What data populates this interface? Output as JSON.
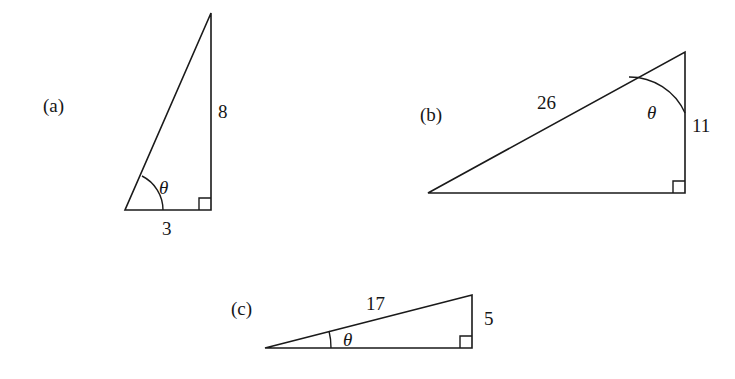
{
  "figure": {
    "background_color": "#ffffff",
    "stroke_color": "#1a1a1a",
    "parts": [
      {
        "id": "a",
        "label": "(a)",
        "label_position": {
          "x": 43,
          "y": 96
        },
        "vertices": {
          "right_angle_corner": {
            "x": 211,
            "y": 210
          },
          "theta_corner": {
            "x": 125,
            "y": 210
          },
          "apex": {
            "x": 211,
            "y": 13
          }
        },
        "sides": [
          {
            "name": "vertical-side",
            "value": "8",
            "x": 218,
            "y": 102
          },
          {
            "name": "horizontal-side",
            "value": "3",
            "x": 162,
            "y": 219
          }
        ],
        "angle": {
          "name": "theta",
          "symbol": "θ",
          "x": 159,
          "y": 178,
          "at": "theta_corner"
        },
        "right_angle_marker": true
      },
      {
        "id": "b",
        "label": "(b)",
        "label_position": {
          "x": 420,
          "y": 105
        },
        "vertices": {
          "right_angle_corner": {
            "x": 685,
            "y": 193
          },
          "theta_corner": {
            "x": 685,
            "y": 52
          },
          "apex": {
            "x": 428,
            "y": 193
          }
        },
        "sides": [
          {
            "name": "hypotenuse",
            "value": "26",
            "x": 537,
            "y": 93
          },
          {
            "name": "vertical-side",
            "value": "11",
            "x": 692,
            "y": 116
          }
        ],
        "angle": {
          "name": "theta",
          "symbol": "θ",
          "x": 647,
          "y": 103,
          "at": "theta_corner"
        },
        "right_angle_marker": true
      },
      {
        "id": "c",
        "label": "(c)",
        "label_position": {
          "x": 231,
          "y": 299
        },
        "vertices": {
          "right_angle_corner": {
            "x": 472,
            "y": 348
          },
          "theta_corner": {
            "x": 265,
            "y": 348
          },
          "apex": {
            "x": 472,
            "y": 295
          }
        },
        "sides": [
          {
            "name": "hypotenuse",
            "value": "17",
            "x": 366,
            "y": 294
          },
          {
            "name": "vertical-side",
            "value": "5",
            "x": 484,
            "y": 309
          }
        ],
        "angle": {
          "name": "theta",
          "symbol": "θ",
          "x": 343,
          "y": 330,
          "at": "theta_corner"
        },
        "right_angle_marker": true
      }
    ]
  }
}
